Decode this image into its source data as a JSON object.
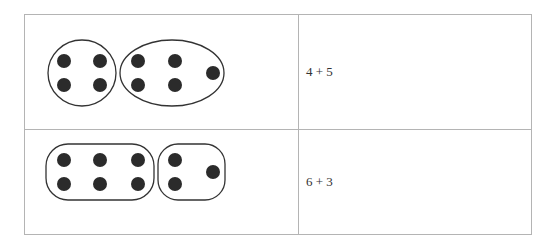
{
  "rows": [
    {
      "expression": "4 + 5",
      "groups": [
        4,
        5
      ],
      "grouping_shape": "oval"
    },
    {
      "expression": "6 + 3",
      "groups": [
        6,
        3
      ],
      "grouping_shape": "rounded-rectangle"
    }
  ],
  "colors": {
    "border": "#b4b4b4",
    "dot": "#2b2b2b",
    "outline": "#333333"
  }
}
